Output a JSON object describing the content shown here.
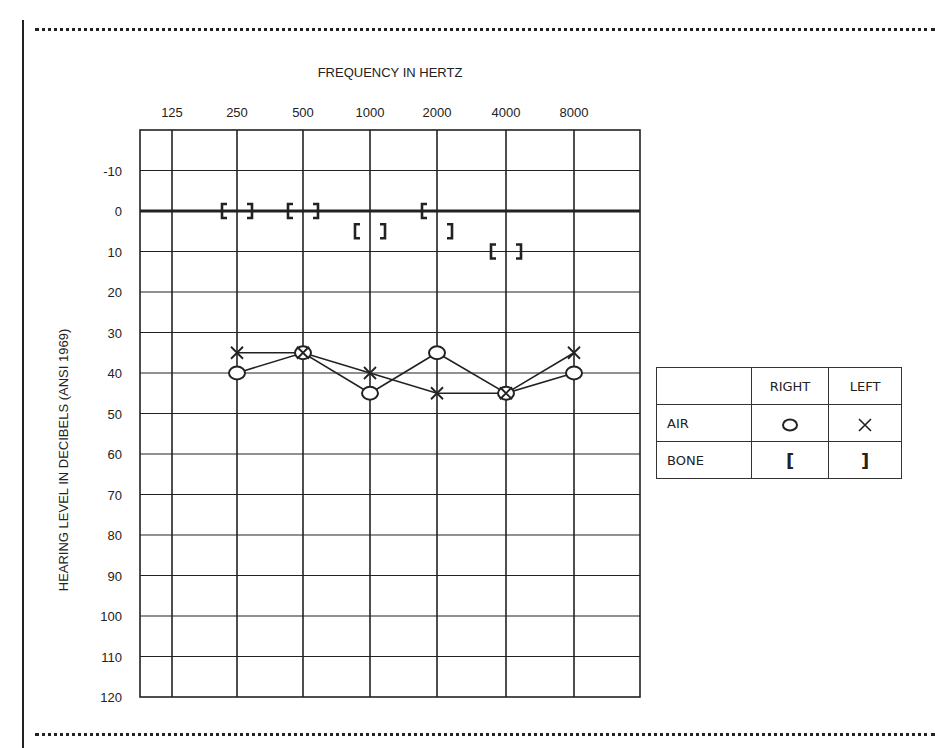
{
  "chart_data": {
    "type": "line",
    "title": "FREQUENCY IN HERTZ",
    "xlabel": "FREQUENCY IN HERTZ",
    "ylabel": "HEARING LEVEL IN DECIBELS (ANSI 1969)",
    "x": [
      "125",
      "250",
      "500",
      "1000",
      "2000",
      "4000",
      "8000"
    ],
    "y_ticks": [
      "-10",
      "0",
      "10",
      "20",
      "30",
      "40",
      "50",
      "60",
      "70",
      "80",
      "90",
      "100",
      "110",
      "120"
    ],
    "ylim": [
      -20,
      120
    ],
    "y_inverted": true,
    "grid": true,
    "series": [
      {
        "name": "AIR RIGHT",
        "marker": "O",
        "x": [
          "250",
          "500",
          "1000",
          "2000",
          "4000",
          "8000"
        ],
        "values": [
          40,
          35,
          45,
          35,
          45,
          40
        ]
      },
      {
        "name": "AIR LEFT",
        "marker": "X",
        "x": [
          "250",
          "500",
          "1000",
          "2000",
          "4000",
          "8000"
        ],
        "values": [
          35,
          35,
          40,
          45,
          45,
          35
        ]
      },
      {
        "name": "BONE RIGHT",
        "marker": "[",
        "x": [
          "250",
          "500",
          "1000",
          "2000",
          "4000"
        ],
        "values": [
          0,
          0,
          5,
          0,
          10
        ]
      },
      {
        "name": "BONE LEFT",
        "marker": "]",
        "x": [
          "250",
          "500",
          "1000",
          "2000",
          "4000"
        ],
        "values": [
          0,
          0,
          5,
          5,
          10
        ]
      }
    ],
    "legend": {
      "position": "right",
      "headers": [
        "",
        "RIGHT",
        "LEFT"
      ],
      "rows": [
        {
          "label": "AIR",
          "right": "O",
          "left": "X"
        },
        {
          "label": "BONE",
          "right": "[",
          "left": "]"
        }
      ]
    }
  },
  "legend": {
    "right_header": "RIGHT",
    "left_header": "LEFT",
    "air_label": "AIR",
    "bone_label": "BONE",
    "bone_right_symbol": "[",
    "bone_left_symbol": "]"
  }
}
